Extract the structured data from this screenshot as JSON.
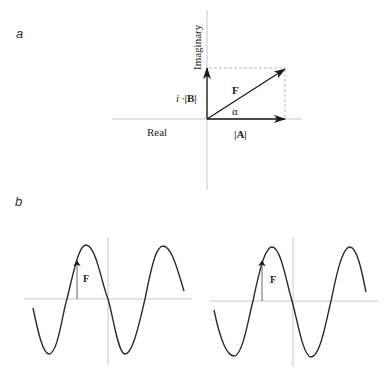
{
  "panels": {
    "a": {
      "label": "a",
      "axes": {
        "vertical_label": "Imaginary",
        "horizontal_label": "Real"
      },
      "vectors": {
        "resultant_label": "F",
        "real_component_label": "|A|",
        "imag_component_prefix": "i ·",
        "imag_component_label": "|B|",
        "angle_label": "α"
      }
    },
    "b": {
      "label": "b",
      "waves": [
        {
          "name": "left-wave",
          "vector_label": "F"
        },
        {
          "name": "right-wave",
          "vector_label": "F"
        }
      ]
    }
  },
  "colors": {
    "axis": "#c8c8c8",
    "vector": "#1a1a1a",
    "dashed": "#bdbdbd",
    "wave": "#2a2a2a",
    "text": "#222222"
  }
}
